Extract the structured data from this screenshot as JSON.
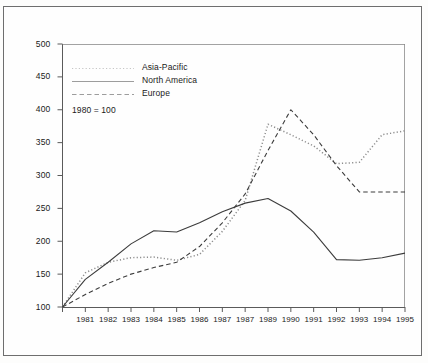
{
  "chart_data": {
    "type": "line",
    "title": "",
    "subtitle": "",
    "xlabel": "",
    "ylabel": "",
    "note": "1980 = 100",
    "legend_position": "top-left-inside",
    "grid": false,
    "xlim": [
      1980,
      1995
    ],
    "ylim": [
      100,
      500
    ],
    "ytick_step": 50,
    "yticks": [
      100,
      150,
      200,
      250,
      300,
      350,
      400,
      450,
      500
    ],
    "ytick_labels": [
      "100",
      "150",
      "200",
      "250",
      "300",
      "350",
      "400",
      "450",
      "500"
    ],
    "x": [
      1980,
      1981,
      1982,
      1983,
      1984,
      1985,
      1986,
      1987,
      1988,
      1989,
      1990,
      1991,
      1992,
      1993,
      1994,
      1995
    ],
    "xtick_labels": [
      "",
      "1981",
      "1982",
      "1983",
      "1984",
      "1985",
      "1986",
      "1987",
      "1987",
      "1989",
      "1990",
      "1991",
      "1992",
      "1993",
      "1994",
      "1995"
    ],
    "series": [
      {
        "name": "Asia-Pacific",
        "style": "dotted",
        "color": "#8d8d8d",
        "values": [
          100,
          152,
          168,
          175,
          176,
          171,
          180,
          215,
          262,
          378,
          362,
          345,
          318,
          320,
          362,
          368
        ]
      },
      {
        "name": "North America",
        "style": "solid",
        "color": "#3c3c3c",
        "values": [
          100,
          142,
          168,
          196,
          216,
          214,
          228,
          245,
          258,
          265,
          246,
          214,
          172,
          171,
          175,
          182
        ]
      },
      {
        "name": "Europe",
        "style": "dashed",
        "color": "#3c3c3c",
        "values": [
          100,
          119,
          136,
          150,
          160,
          168,
          192,
          228,
          272,
          338,
          400,
          362,
          315,
          275,
          275,
          275
        ]
      }
    ]
  },
  "legend": {
    "items": [
      {
        "label": "Asia-Pacific"
      },
      {
        "label": "North America"
      },
      {
        "label": "Europe"
      }
    ],
    "note": "1980 = 100"
  }
}
